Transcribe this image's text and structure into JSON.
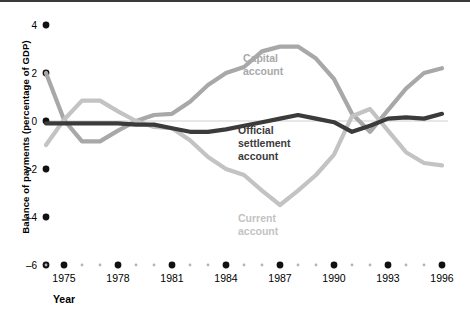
{
  "chart_data": {
    "type": "line",
    "title": "",
    "xlabel": "Year",
    "ylabel": "Balance of payments (percentage of GDP)",
    "xlim": [
      1974,
      1996
    ],
    "ylim": [
      -6,
      4
    ],
    "yticks": [
      4,
      2,
      0,
      -2,
      -4,
      -6
    ],
    "ytick_labels": [
      "4",
      "2",
      "0",
      "–2",
      "–4",
      "–6"
    ],
    "xticks": [
      1975,
      1978,
      1981,
      1984,
      1987,
      1990,
      1993,
      1996
    ],
    "xtick_labels": [
      "1975",
      "1978",
      "1981",
      "1984",
      "1987",
      "1990",
      "1993",
      "1996"
    ],
    "minor_x": [
      1974,
      1976,
      1977,
      1979,
      1980,
      1982,
      1983,
      1985,
      1986,
      1988,
      1989,
      1991,
      1992,
      1994,
      1995
    ],
    "grid": false,
    "legend_position": "inline-annotations",
    "x": [
      1974,
      1975,
      1976,
      1977,
      1978,
      1979,
      1980,
      1981,
      1982,
      1983,
      1984,
      1985,
      1986,
      1987,
      1988,
      1989,
      1990,
      1991,
      1992,
      1993,
      1994,
      1995,
      1996
    ],
    "series": [
      {
        "name": "Capital account",
        "color": "#a8a8a8",
        "label_lines": [
          "Capital",
          "account"
        ],
        "values": [
          2.0,
          0.05,
          -0.85,
          -0.85,
          -0.4,
          0.0,
          0.25,
          0.3,
          0.8,
          1.5,
          2.0,
          2.25,
          2.9,
          3.1,
          3.1,
          2.6,
          1.75,
          0.3,
          -0.45,
          0.45,
          1.35,
          2.0,
          2.2
        ]
      },
      {
        "name": "Official settlement account",
        "color": "#3b3b3b",
        "label_lines": [
          "Official",
          "settlement",
          "account"
        ],
        "values": [
          -0.1,
          -0.1,
          -0.1,
          -0.1,
          -0.1,
          -0.15,
          -0.15,
          -0.3,
          -0.45,
          -0.45,
          -0.35,
          -0.2,
          -0.05,
          0.1,
          0.25,
          0.1,
          -0.05,
          -0.45,
          -0.2,
          0.1,
          0.15,
          0.1,
          0.3
        ]
      },
      {
        "name": "Current account",
        "color": "#c3c3c3",
        "label_lines": [
          "Current",
          "account"
        ],
        "values": [
          -1.0,
          0.05,
          0.85,
          0.85,
          0.4,
          0.0,
          -0.25,
          -0.3,
          -0.8,
          -1.5,
          -2.0,
          -2.25,
          -2.9,
          -3.5,
          -2.9,
          -2.25,
          -1.4,
          0.2,
          0.5,
          -0.4,
          -1.3,
          -1.75,
          -1.85
        ]
      }
    ]
  },
  "annotations": {
    "capital_label": "Capital\naccount",
    "official_label": "Official\nsettlement\naccount",
    "current_label": "Current\naccount"
  }
}
